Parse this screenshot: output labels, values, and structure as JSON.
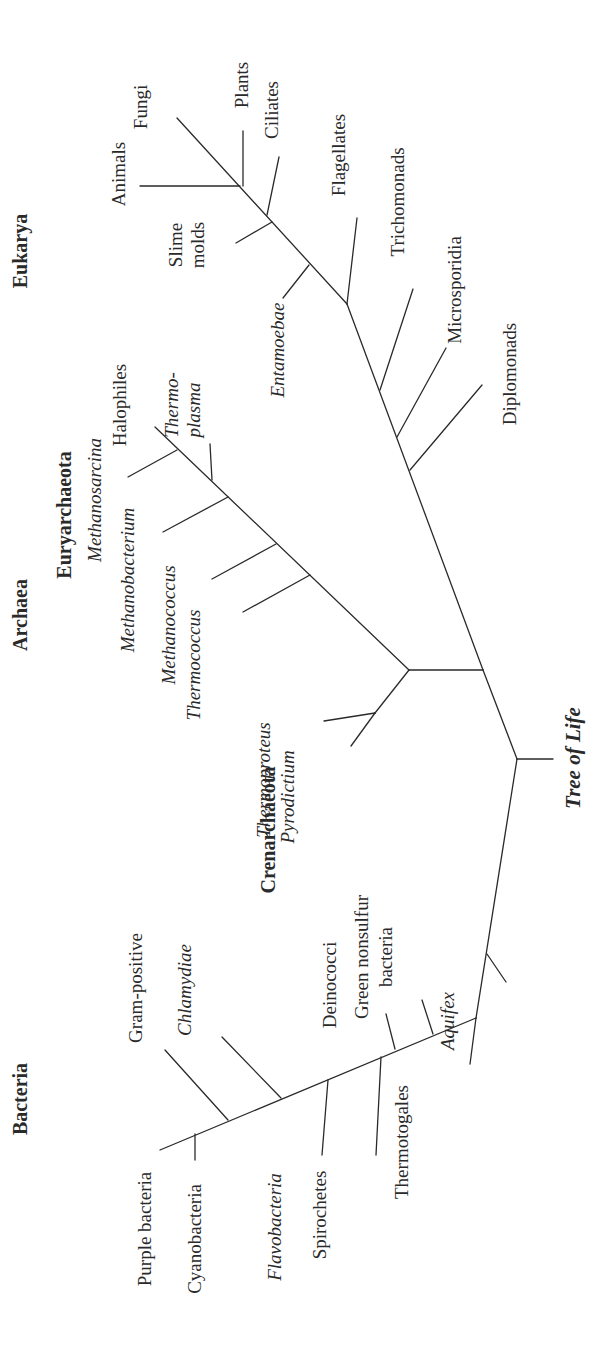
{
  "title": "Tree of Life",
  "domains": [
    {
      "id": "eukarya",
      "label": "Eukarya"
    },
    {
      "id": "archaea",
      "label": "Archaea"
    },
    {
      "id": "bacteria",
      "label": "Bacteria"
    }
  ],
  "subgroups": [
    {
      "id": "euryarchaeota",
      "label": "Euryarchaeota"
    },
    {
      "id": "crenarchaeota",
      "label": "Crenarchaeota"
    }
  ],
  "colors": {
    "line": "#2a2a2a",
    "text": "#2a2a2a",
    "background": "#ffffff"
  },
  "labels": [
    {
      "id": "eukarya",
      "text": "Eukarya",
      "style": "bold",
      "x": 27,
      "y": 251,
      "size": 20
    },
    {
      "id": "archaea",
      "text": "Archaea",
      "style": "bold",
      "x": 27,
      "y": 615,
      "size": 20
    },
    {
      "id": "bacteria",
      "text": "Bacteria",
      "style": "bold",
      "x": 27,
      "y": 1099,
      "size": 20
    },
    {
      "id": "euryarchaeota",
      "text": "Euryarchaeota",
      "style": "bold",
      "x": 71,
      "y": 515,
      "size": 20
    },
    {
      "id": "crenarchaeota",
      "text": "Crenarchaeota",
      "style": "bold",
      "x": 275,
      "y": 830,
      "size": 20
    },
    {
      "id": "tree-of-life",
      "text": "Tree of Life",
      "style": "title",
      "x": 580,
      "y": 758,
      "size": 21
    },
    {
      "id": "animals",
      "text": "Animals",
      "style": "normal",
      "x": 125,
      "y": 174
    },
    {
      "id": "fungi",
      "text": "Fungi",
      "style": "normal",
      "x": 147,
      "y": 107
    },
    {
      "id": "plants",
      "text": "Plants",
      "style": "normal",
      "x": 248,
      "y": 85
    },
    {
      "id": "ciliates",
      "text": "Ciliates",
      "style": "normal",
      "x": 278,
      "y": 110
    },
    {
      "id": "slime",
      "text": "Slime",
      "style": "normal",
      "x": 182,
      "y": 245
    },
    {
      "id": "molds",
      "text": "molds",
      "style": "normal",
      "x": 204,
      "y": 245
    },
    {
      "id": "flagellates",
      "text": "Flagellates",
      "style": "normal",
      "x": 345,
      "y": 155
    },
    {
      "id": "entamoebae",
      "text": "Entamoebae",
      "style": "italic",
      "x": 284,
      "y": 350
    },
    {
      "id": "trichomonads",
      "text": "Trichomonads",
      "style": "normal",
      "x": 404,
      "y": 202
    },
    {
      "id": "microsporidia",
      "text": "Microsporidia",
      "style": "normal",
      "x": 461,
      "y": 290
    },
    {
      "id": "diplomonads",
      "text": "Diplomonads",
      "style": "normal",
      "x": 516,
      "y": 374
    },
    {
      "id": "halophiles",
      "text": "Halophiles",
      "style": "normal",
      "x": 126,
      "y": 405
    },
    {
      "id": "methanosarcina",
      "text": "Methanosarcina",
      "style": "italic",
      "x": 101,
      "y": 500
    },
    {
      "id": "thermo",
      "text": "Thermo-",
      "style": "italic",
      "x": 178,
      "y": 405
    },
    {
      "id": "plasma",
      "text": "plasma",
      "style": "italic",
      "x": 200,
      "y": 410
    },
    {
      "id": "methanobacterium",
      "text": "Methanobacterium",
      "style": "italic",
      "x": 134,
      "y": 580
    },
    {
      "id": "methanococcus",
      "text": "Methanococcus",
      "style": "italic",
      "x": 175,
      "y": 625
    },
    {
      "id": "thermococcus",
      "text": "Thermococcus",
      "style": "italic",
      "x": 200,
      "y": 665
    },
    {
      "id": "thermoproteus",
      "text": "Thermoproteus",
      "style": "italic",
      "x": 270,
      "y": 780
    },
    {
      "id": "pyrodictium",
      "text": "Pyrodictium",
      "style": "italic",
      "x": 294,
      "y": 797
    },
    {
      "id": "gram-positive",
      "text": "Gram-positive",
      "style": "normal",
      "x": 142,
      "y": 988
    },
    {
      "id": "chlamydiae",
      "text": "Chlamydiae",
      "style": "italic",
      "x": 191,
      "y": 990
    },
    {
      "id": "deinococci",
      "text": "Deinococci",
      "style": "normal",
      "x": 336,
      "y": 985
    },
    {
      "id": "green-nonsulfur",
      "text": "Green nonsulfur",
      "style": "normal",
      "x": 368,
      "y": 957
    },
    {
      "id": "green-bacteria",
      "text": "bacteria",
      "style": "normal",
      "x": 392,
      "y": 957
    },
    {
      "id": "aquifex",
      "text": "Aquifex",
      "style": "italic",
      "x": 454,
      "y": 1021
    },
    {
      "id": "thermotogales",
      "text": "Thermotogales",
      "style": "normal",
      "x": 408,
      "y": 1142
    },
    {
      "id": "purple-bacteria",
      "text": "Purple bacteria",
      "style": "normal",
      "x": 151,
      "y": 1229
    },
    {
      "id": "cyanobacteria",
      "text": "Cyanobacteria",
      "style": "normal",
      "x": 201,
      "y": 1239
    },
    {
      "id": "flavobacteria",
      "text": "Flavobacteria",
      "style": "italic",
      "x": 281,
      "y": 1227
    },
    {
      "id": "spirochetes",
      "text": "Spirochetes",
      "style": "normal",
      "x": 326,
      "y": 1215
    }
  ],
  "branches": [
    {
      "id": "root-stub",
      "x1": 517,
      "y1": 759,
      "x2": 553,
      "y2": 759
    },
    {
      "id": "root-to-euk-arch",
      "x1": 517,
      "y1": 759,
      "x2": 483,
      "y2": 670
    },
    {
      "id": "root-to-bacteria",
      "x1": 517,
      "y1": 759,
      "x2": 476,
      "y2": 1018
    },
    {
      "id": "arch-stem",
      "x1": 483,
      "y1": 670,
      "x2": 409,
      "y2": 670
    },
    {
      "id": "euk-stem",
      "x1": 483,
      "y1": 670,
      "x2": 347,
      "y2": 304
    },
    {
      "id": "eury-line",
      "x1": 409,
      "y1": 670,
      "x2": 155,
      "y2": 427
    },
    {
      "id": "methanosarcina",
      "x1": 177,
      "y1": 450,
      "x2": 128,
      "y2": 477
    },
    {
      "id": "thermoplasma",
      "x1": 212,
      "y1": 480,
      "x2": 210,
      "y2": 444
    },
    {
      "id": "methanobacterium",
      "x1": 228,
      "y1": 497,
      "x2": 163,
      "y2": 532
    },
    {
      "id": "methanococcus",
      "x1": 276,
      "y1": 544,
      "x2": 212,
      "y2": 579
    },
    {
      "id": "thermococcus",
      "x1": 310,
      "y1": 575,
      "x2": 243,
      "y2": 612
    },
    {
      "id": "cren-stem",
      "x1": 409,
      "y1": 670,
      "x2": 375,
      "y2": 713
    },
    {
      "id": "thermoproteus",
      "x1": 375,
      "y1": 713,
      "x2": 324,
      "y2": 721
    },
    {
      "id": "pyrodictium",
      "x1": 375,
      "y1": 713,
      "x2": 351,
      "y2": 746
    },
    {
      "id": "diplomonads",
      "x1": 410,
      "y1": 470,
      "x2": 482,
      "y2": 385
    },
    {
      "id": "microsporidia",
      "x1": 397,
      "y1": 437,
      "x2": 446,
      "y2": 348
    },
    {
      "id": "trichomonads",
      "x1": 380,
      "y1": 390,
      "x2": 413,
      "y2": 289
    },
    {
      "id": "flagellates",
      "x1": 347,
      "y1": 304,
      "x2": 357,
      "y2": 218
    },
    {
      "id": "euk-crown",
      "x1": 347,
      "y1": 304,
      "x2": 177,
      "y2": 118
    },
    {
      "id": "entamoebae",
      "x1": 309,
      "y1": 265,
      "x2": 283,
      "y2": 298
    },
    {
      "id": "slime-molds",
      "x1": 272,
      "y1": 222,
      "x2": 236,
      "y2": 243
    },
    {
      "id": "ciliates",
      "x1": 267,
      "y1": 215,
      "x2": 279,
      "y2": 157
    },
    {
      "id": "plants",
      "x1": 243,
      "y1": 186,
      "x2": 243,
      "y2": 131
    },
    {
      "id": "animals",
      "x1": 240,
      "y1": 186,
      "x2": 140,
      "y2": 186
    },
    {
      "id": "aquifex",
      "x1": 487,
      "y1": 954,
      "x2": 506,
      "y2": 982
    },
    {
      "id": "bact-line",
      "x1": 476,
      "y1": 1018,
      "x2": 160,
      "y2": 1150
    },
    {
      "id": "thermotogales",
      "x1": 476,
      "y1": 1018,
      "x2": 470,
      "y2": 1064
    },
    {
      "id": "green-nonsulfur",
      "x1": 433,
      "y1": 1034,
      "x2": 422,
      "y2": 1000
    },
    {
      "id": "deinococci",
      "x1": 395,
      "y1": 1049,
      "x2": 386,
      "y2": 1014
    },
    {
      "id": "spirochetes",
      "x1": 381,
      "y1": 1057,
      "x2": 376,
      "y2": 1155
    },
    {
      "id": "flavobacteria",
      "x1": 328,
      "y1": 1080,
      "x2": 322,
      "y2": 1155
    },
    {
      "id": "chlamydiae",
      "x1": 281,
      "y1": 1098,
      "x2": 222,
      "y2": 1037
    },
    {
      "id": "gram-positive",
      "x1": 228,
      "y1": 1120,
      "x2": 165,
      "y2": 1050
    },
    {
      "id": "cyanobacteria",
      "x1": 195,
      "y1": 1134,
      "x2": 195,
      "y2": 1160
    }
  ]
}
